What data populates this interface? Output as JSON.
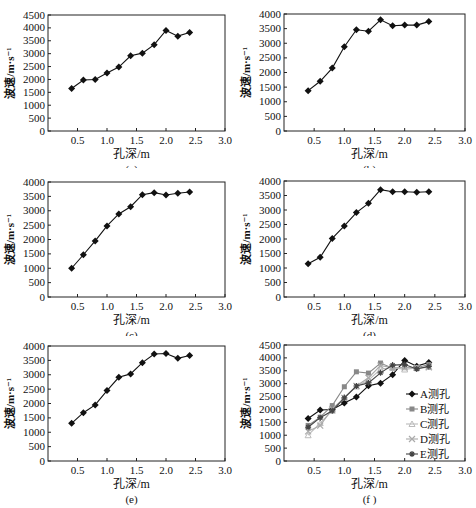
{
  "figure": {
    "panels": [
      {
        "id": "a",
        "caption": "(a)"
      },
      {
        "id": "b",
        "caption": "(b)"
      },
      {
        "id": "c",
        "caption": "(c)"
      },
      {
        "id": "d",
        "caption": "(d)"
      },
      {
        "id": "e",
        "caption": "(e)"
      },
      {
        "id": "f",
        "caption": "(f)"
      }
    ]
  },
  "chart_data": [
    {
      "panel": "a",
      "type": "line",
      "title": "",
      "caption": "(a)",
      "xlabel": "孔深/m",
      "ylabel": "波速/m·s⁻¹",
      "xlim": [
        0,
        3.0
      ],
      "ylim": [
        0,
        4500
      ],
      "xticks": [
        "0.5",
        "1.0",
        "1.5",
        "2.0",
        "2.5",
        "3.0"
      ],
      "yticks": [
        "0",
        "500",
        "1000",
        "1500",
        "2000",
        "2500",
        "3000",
        "3500",
        "4000",
        "4500"
      ],
      "grid": false,
      "series": [
        {
          "name": "A测孔",
          "color": "#111111",
          "x": [
            0.4,
            0.6,
            0.8,
            1.0,
            1.2,
            1.4,
            1.6,
            1.8,
            2.0,
            2.2,
            2.4
          ],
          "values": [
            1650,
            1980,
            2000,
            2250,
            2480,
            2920,
            3020,
            3350,
            3900,
            3680,
            3820
          ]
        }
      ]
    },
    {
      "panel": "b",
      "type": "line",
      "title": "",
      "caption": "(b)",
      "xlabel": "孔深/m",
      "ylabel": "波速/m·s⁻¹",
      "xlim": [
        0,
        3.0
      ],
      "ylim": [
        0,
        4000
      ],
      "xticks": [
        "0.5",
        "1.0",
        "1.5",
        "2.0",
        "2.5",
        "3.0"
      ],
      "yticks": [
        "0",
        "500",
        "1000",
        "1500",
        "2000",
        "2500",
        "3000",
        "3500",
        "4000"
      ],
      "grid": false,
      "series": [
        {
          "name": "B测孔",
          "color": "#111111",
          "x": [
            0.4,
            0.6,
            0.8,
            1.0,
            1.2,
            1.4,
            1.6,
            1.8,
            2.0,
            2.2,
            2.4
          ],
          "values": [
            1380,
            1700,
            2150,
            2880,
            3460,
            3410,
            3800,
            3600,
            3620,
            3620,
            3740
          ]
        }
      ]
    },
    {
      "panel": "c",
      "type": "line",
      "title": "",
      "caption": "(c)",
      "xlabel": "孔深/m",
      "ylabel": "波速/m·s⁻¹",
      "xlim": [
        0,
        3.0
      ],
      "ylim": [
        0,
        4000
      ],
      "xticks": [
        "0.5",
        "1.0",
        "1.5",
        "2.0",
        "2.5",
        "3.0"
      ],
      "yticks": [
        "0",
        "500",
        "1000",
        "1500",
        "2000",
        "2500",
        "3000",
        "3500",
        "4000"
      ],
      "grid": false,
      "series": [
        {
          "name": "C测孔",
          "color": "#111111",
          "x": [
            0.4,
            0.6,
            0.8,
            1.0,
            1.2,
            1.4,
            1.6,
            1.8,
            2.0,
            2.2,
            2.4
          ],
          "values": [
            1000,
            1470,
            1950,
            2470,
            2890,
            3140,
            3560,
            3630,
            3550,
            3610,
            3650
          ]
        }
      ]
    },
    {
      "panel": "d",
      "type": "line",
      "title": "",
      "caption": "(d)",
      "xlabel": "孔深/m",
      "ylabel": "波速/m·s⁻¹",
      "xlim": [
        0,
        3.0
      ],
      "ylim": [
        0,
        4000
      ],
      "xticks": [
        "0.5",
        "1.0",
        "1.5",
        "2.0",
        "2.5",
        "3.0"
      ],
      "yticks": [
        "0",
        "500",
        "1000",
        "1500",
        "2000",
        "2500",
        "3000",
        "3500",
        "4000"
      ],
      "grid": false,
      "series": [
        {
          "name": "D测孔",
          "color": "#111111",
          "x": [
            0.4,
            0.6,
            0.8,
            1.0,
            1.2,
            1.4,
            1.6,
            1.8,
            2.0,
            2.2,
            2.4
          ],
          "values": [
            1150,
            1370,
            2020,
            2450,
            2910,
            3230,
            3700,
            3630,
            3630,
            3610,
            3630
          ]
        }
      ]
    },
    {
      "panel": "e",
      "type": "line",
      "title": "",
      "caption": "(e)",
      "xlabel": "孔深/m",
      "ylabel": "波速/m·s⁻¹",
      "xlim": [
        0,
        3.0
      ],
      "ylim": [
        0,
        4000
      ],
      "xticks": [
        "0.5",
        "1.0",
        "1.5",
        "2.0",
        "2.5",
        "3.0"
      ],
      "yticks": [
        "0",
        "500",
        "1000",
        "1500",
        "2000",
        "2500",
        "3000",
        "3500",
        "4000"
      ],
      "grid": false,
      "series": [
        {
          "name": "E测孔",
          "color": "#111111",
          "x": [
            0.4,
            0.6,
            0.8,
            1.0,
            1.2,
            1.4,
            1.6,
            1.8,
            2.0,
            2.2,
            2.4
          ],
          "values": [
            1310,
            1680,
            1950,
            2450,
            2910,
            3030,
            3420,
            3720,
            3740,
            3570,
            3670
          ]
        }
      ]
    },
    {
      "panel": "f",
      "type": "line",
      "title": "",
      "caption": "(f )",
      "xlabel": "孔深/m",
      "ylabel": "波速/m·s⁻¹",
      "xlim": [
        0,
        3.0
      ],
      "ylim": [
        0,
        4500
      ],
      "xticks": [
        "0.5",
        "1.0",
        "1.5",
        "2.0",
        "2.5",
        "3.0"
      ],
      "yticks": [
        "0",
        "500",
        "1000",
        "1500",
        "2000",
        "2500",
        "3000",
        "3500",
        "4000",
        "4500"
      ],
      "grid": false,
      "legend": {
        "position": "right-center",
        "entries": [
          "A测孔",
          "B测孔",
          "C测孔",
          "D测孔",
          "E测孔"
        ]
      },
      "x": [
        0.4,
        0.6,
        0.8,
        1.0,
        1.2,
        1.4,
        1.6,
        1.8,
        2.0,
        2.2,
        2.4
      ],
      "series": [
        {
          "name": "A测孔",
          "color": "#111111",
          "marker": "diamond",
          "values": [
            1650,
            1980,
            2000,
            2250,
            2480,
            2920,
            3020,
            3350,
            3900,
            3680,
            3820
          ]
        },
        {
          "name": "B测孔",
          "color": "#888888",
          "marker": "square",
          "values": [
            1380,
            1700,
            2150,
            2880,
            3460,
            3410,
            3800,
            3600,
            3620,
            3620,
            3740
          ]
        },
        {
          "name": "C测孔",
          "color": "#bbbbbb",
          "marker": "triangle",
          "values": [
            1000,
            1470,
            1950,
            2470,
            2890,
            3140,
            3560,
            3630,
            3550,
            3610,
            3650
          ]
        },
        {
          "name": "D测孔",
          "color": "#aaaaaa",
          "marker": "x",
          "values": [
            1150,
            1370,
            2020,
            2450,
            2910,
            3230,
            3700,
            3630,
            3630,
            3610,
            3630
          ]
        },
        {
          "name": "E测孔",
          "color": "#444444",
          "marker": "asterisk",
          "values": [
            1310,
            1680,
            1950,
            2450,
            2910,
            3030,
            3420,
            3720,
            3740,
            3570,
            3670
          ]
        }
      ]
    }
  ]
}
